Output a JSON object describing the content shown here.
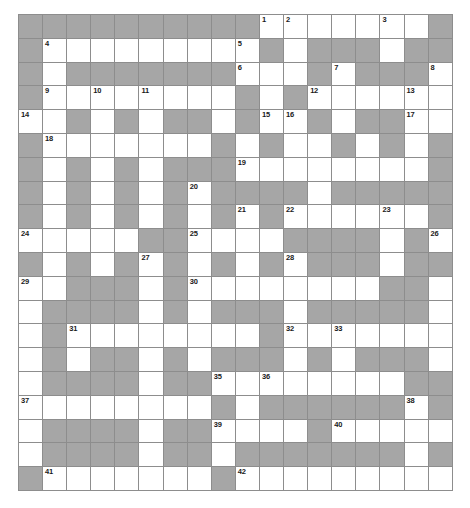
{
  "puzzle": {
    "kind": "crossword-grid",
    "title": "",
    "columns": 18,
    "rows": 20,
    "cell_size_px": 24,
    "colors": {
      "block": "#a6a6a6",
      "open": "#ffffff",
      "grid_line": "#8d8d8d",
      "number_text": "#1a1a1a",
      "page_background": "#ffffff"
    },
    "legend": {
      "block_meaning": "blocked square",
      "open_meaning": "fillable letter square"
    },
    "clue_numbers_present": [
      1,
      2,
      3,
      4,
      5,
      6,
      7,
      8,
      9,
      10,
      11,
      12,
      13,
      14,
      15,
      16,
      17,
      18,
      19,
      20,
      21,
      22,
      23,
      24,
      25,
      26,
      27,
      28,
      29,
      30,
      31,
      32,
      33,
      35,
      36,
      37,
      38,
      39,
      40,
      41,
      42
    ],
    "clue_number_count": 41,
    "max_clue_number": 42,
    "cells": [
      [
        {
          "t": "block"
        },
        {
          "t": "block"
        },
        {
          "t": "block"
        },
        {
          "t": "block"
        },
        {
          "t": "block"
        },
        {
          "t": "block"
        },
        {
          "t": "block"
        },
        {
          "t": "block"
        },
        {
          "t": "block"
        },
        {
          "t": "block"
        },
        {
          "t": "open",
          "n": "1"
        },
        {
          "t": "open",
          "n": "2"
        },
        {
          "t": "open"
        },
        {
          "t": "open"
        },
        {
          "t": "open"
        },
        {
          "t": "open",
          "n": "3"
        },
        {
          "t": "open"
        },
        {
          "t": "block"
        }
      ],
      [
        {
          "t": "block"
        },
        {
          "t": "open",
          "n": "4"
        },
        {
          "t": "open"
        },
        {
          "t": "open"
        },
        {
          "t": "open"
        },
        {
          "t": "open"
        },
        {
          "t": "open"
        },
        {
          "t": "open"
        },
        {
          "t": "open"
        },
        {
          "t": "open",
          "n": "5"
        },
        {
          "t": "block"
        },
        {
          "t": "open"
        },
        {
          "t": "block"
        },
        {
          "t": "block"
        },
        {
          "t": "block"
        },
        {
          "t": "open"
        },
        {
          "t": "block"
        },
        {
          "t": "block"
        }
      ],
      [
        {
          "t": "block"
        },
        {
          "t": "open"
        },
        {
          "t": "block"
        },
        {
          "t": "block"
        },
        {
          "t": "block"
        },
        {
          "t": "block"
        },
        {
          "t": "block"
        },
        {
          "t": "block"
        },
        {
          "t": "block"
        },
        {
          "t": "open",
          "n": "6"
        },
        {
          "t": "open"
        },
        {
          "t": "open"
        },
        {
          "t": "block"
        },
        {
          "t": "open",
          "n": "7"
        },
        {
          "t": "block"
        },
        {
          "t": "block"
        },
        {
          "t": "block"
        },
        {
          "t": "open",
          "n": "8"
        }
      ],
      [
        {
          "t": "block"
        },
        {
          "t": "open",
          "n": "9"
        },
        {
          "t": "open"
        },
        {
          "t": "open",
          "n": "10"
        },
        {
          "t": "open"
        },
        {
          "t": "open",
          "n": "11"
        },
        {
          "t": "open"
        },
        {
          "t": "open"
        },
        {
          "t": "open"
        },
        {
          "t": "block"
        },
        {
          "t": "open"
        },
        {
          "t": "block"
        },
        {
          "t": "open",
          "n": "12"
        },
        {
          "t": "open"
        },
        {
          "t": "open"
        },
        {
          "t": "open"
        },
        {
          "t": "open",
          "n": "13"
        },
        {
          "t": "open"
        }
      ],
      [
        {
          "t": "open",
          "n": "14"
        },
        {
          "t": "open"
        },
        {
          "t": "block"
        },
        {
          "t": "open"
        },
        {
          "t": "block"
        },
        {
          "t": "open"
        },
        {
          "t": "block"
        },
        {
          "t": "block"
        },
        {
          "t": "open"
        },
        {
          "t": "block"
        },
        {
          "t": "open",
          "n": "15"
        },
        {
          "t": "open",
          "n": "16"
        },
        {
          "t": "block"
        },
        {
          "t": "open"
        },
        {
          "t": "block"
        },
        {
          "t": "block"
        },
        {
          "t": "open",
          "n": "17"
        },
        {
          "t": "open"
        }
      ],
      [
        {
          "t": "block"
        },
        {
          "t": "open",
          "n": "18"
        },
        {
          "t": "open"
        },
        {
          "t": "open"
        },
        {
          "t": "open"
        },
        {
          "t": "open"
        },
        {
          "t": "open"
        },
        {
          "t": "open"
        },
        {
          "t": "block"
        },
        {
          "t": "open"
        },
        {
          "t": "block"
        },
        {
          "t": "open"
        },
        {
          "t": "open"
        },
        {
          "t": "block"
        },
        {
          "t": "open"
        },
        {
          "t": "block"
        },
        {
          "t": "open"
        },
        {
          "t": "block"
        }
      ],
      [
        {
          "t": "block"
        },
        {
          "t": "open"
        },
        {
          "t": "block"
        },
        {
          "t": "open"
        },
        {
          "t": "block"
        },
        {
          "t": "open"
        },
        {
          "t": "block"
        },
        {
          "t": "block"
        },
        {
          "t": "block"
        },
        {
          "t": "open",
          "n": "19"
        },
        {
          "t": "open"
        },
        {
          "t": "open"
        },
        {
          "t": "open"
        },
        {
          "t": "open"
        },
        {
          "t": "open"
        },
        {
          "t": "open"
        },
        {
          "t": "open"
        },
        {
          "t": "block"
        }
      ],
      [
        {
          "t": "block"
        },
        {
          "t": "open"
        },
        {
          "t": "block"
        },
        {
          "t": "open"
        },
        {
          "t": "block"
        },
        {
          "t": "open"
        },
        {
          "t": "block"
        },
        {
          "t": "open",
          "n": "20"
        },
        {
          "t": "block"
        },
        {
          "t": "block"
        },
        {
          "t": "block"
        },
        {
          "t": "block"
        },
        {
          "t": "open"
        },
        {
          "t": "block"
        },
        {
          "t": "block"
        },
        {
          "t": "block"
        },
        {
          "t": "block"
        },
        {
          "t": "block"
        }
      ],
      [
        {
          "t": "block"
        },
        {
          "t": "open"
        },
        {
          "t": "block"
        },
        {
          "t": "open"
        },
        {
          "t": "block"
        },
        {
          "t": "open"
        },
        {
          "t": "block"
        },
        {
          "t": "open"
        },
        {
          "t": "block"
        },
        {
          "t": "open",
          "n": "21"
        },
        {
          "t": "block"
        },
        {
          "t": "open",
          "n": "22"
        },
        {
          "t": "open"
        },
        {
          "t": "open"
        },
        {
          "t": "open"
        },
        {
          "t": "open",
          "n": "23"
        },
        {
          "t": "open"
        },
        {
          "t": "block"
        }
      ],
      [
        {
          "t": "open",
          "n": "24"
        },
        {
          "t": "open"
        },
        {
          "t": "open"
        },
        {
          "t": "open"
        },
        {
          "t": "open"
        },
        {
          "t": "block"
        },
        {
          "t": "block"
        },
        {
          "t": "open",
          "n": "25"
        },
        {
          "t": "open"
        },
        {
          "t": "open"
        },
        {
          "t": "open"
        },
        {
          "t": "block"
        },
        {
          "t": "block"
        },
        {
          "t": "block"
        },
        {
          "t": "block"
        },
        {
          "t": "open"
        },
        {
          "t": "block"
        },
        {
          "t": "open",
          "n": "26"
        }
      ],
      [
        {
          "t": "block"
        },
        {
          "t": "open"
        },
        {
          "t": "block"
        },
        {
          "t": "open"
        },
        {
          "t": "block"
        },
        {
          "t": "open",
          "n": "27"
        },
        {
          "t": "block"
        },
        {
          "t": "open"
        },
        {
          "t": "block"
        },
        {
          "t": "open"
        },
        {
          "t": "block"
        },
        {
          "t": "open",
          "n": "28"
        },
        {
          "t": "block"
        },
        {
          "t": "block"
        },
        {
          "t": "block"
        },
        {
          "t": "open"
        },
        {
          "t": "block"
        },
        {
          "t": "block"
        }
      ],
      [
        {
          "t": "open",
          "n": "29"
        },
        {
          "t": "open"
        },
        {
          "t": "block"
        },
        {
          "t": "block"
        },
        {
          "t": "block"
        },
        {
          "t": "open"
        },
        {
          "t": "block"
        },
        {
          "t": "open",
          "n": "30"
        },
        {
          "t": "open"
        },
        {
          "t": "open"
        },
        {
          "t": "open"
        },
        {
          "t": "open"
        },
        {
          "t": "open"
        },
        {
          "t": "open"
        },
        {
          "t": "open"
        },
        {
          "t": "block"
        },
        {
          "t": "block"
        },
        {
          "t": "open"
        }
      ],
      [
        {
          "t": "open"
        },
        {
          "t": "block"
        },
        {
          "t": "block"
        },
        {
          "t": "block"
        },
        {
          "t": "block"
        },
        {
          "t": "open"
        },
        {
          "t": "block"
        },
        {
          "t": "open"
        },
        {
          "t": "block"
        },
        {
          "t": "block"
        },
        {
          "t": "block"
        },
        {
          "t": "open"
        },
        {
          "t": "block"
        },
        {
          "t": "block"
        },
        {
          "t": "block"
        },
        {
          "t": "block"
        },
        {
          "t": "block"
        },
        {
          "t": "open"
        }
      ],
      [
        {
          "t": "open"
        },
        {
          "t": "block"
        },
        {
          "t": "open",
          "n": "31"
        },
        {
          "t": "open"
        },
        {
          "t": "open"
        },
        {
          "t": "open"
        },
        {
          "t": "open"
        },
        {
          "t": "open"
        },
        {
          "t": "open"
        },
        {
          "t": "open"
        },
        {
          "t": "block"
        },
        {
          "t": "open",
          "n": "32"
        },
        {
          "t": "open"
        },
        {
          "t": "open",
          "n": "33"
        },
        {
          "t": "open"
        },
        {
          "t": "open"
        },
        {
          "t": "open"
        },
        {
          "t": "open"
        }
      ],
      [
        {
          "t": "open"
        },
        {
          "t": "block"
        },
        {
          "t": "open"
        },
        {
          "t": "block"
        },
        {
          "t": "block"
        },
        {
          "t": "open"
        },
        {
          "t": "block"
        },
        {
          "t": "open"
        },
        {
          "t": "block"
        },
        {
          "t": "block"
        },
        {
          "t": "block"
        },
        {
          "t": "open"
        },
        {
          "t": "block"
        },
        {
          "t": "open"
        },
        {
          "t": "block"
        },
        {
          "t": "block"
        },
        {
          "t": "block"
        },
        {
          "t": "open"
        }
      ],
      [
        {
          "t": "open"
        },
        {
          "t": "block"
        },
        {
          "t": "block"
        },
        {
          "t": "block"
        },
        {
          "t": "block"
        },
        {
          "t": "open"
        },
        {
          "t": "block"
        },
        {
          "t": "block"
        },
        {
          "t": "open",
          "n": "35"
        },
        {
          "t": "open"
        },
        {
          "t": "open",
          "n": "36"
        },
        {
          "t": "open"
        },
        {
          "t": "open"
        },
        {
          "t": "open"
        },
        {
          "t": "open"
        },
        {
          "t": "open"
        },
        {
          "t": "block"
        },
        {
          "t": "block"
        }
      ],
      [
        {
          "t": "open",
          "n": "37"
        },
        {
          "t": "open"
        },
        {
          "t": "open"
        },
        {
          "t": "open"
        },
        {
          "t": "open"
        },
        {
          "t": "open"
        },
        {
          "t": "open"
        },
        {
          "t": "open"
        },
        {
          "t": "block"
        },
        {
          "t": "open"
        },
        {
          "t": "block"
        },
        {
          "t": "block"
        },
        {
          "t": "block"
        },
        {
          "t": "block"
        },
        {
          "t": "block"
        },
        {
          "t": "block"
        },
        {
          "t": "open",
          "n": "38"
        },
        {
          "t": "block"
        }
      ],
      [
        {
          "t": "open"
        },
        {
          "t": "block"
        },
        {
          "t": "block"
        },
        {
          "t": "block"
        },
        {
          "t": "block"
        },
        {
          "t": "open"
        },
        {
          "t": "block"
        },
        {
          "t": "block"
        },
        {
          "t": "open",
          "n": "39"
        },
        {
          "t": "open"
        },
        {
          "t": "open"
        },
        {
          "t": "open"
        },
        {
          "t": "block"
        },
        {
          "t": "open",
          "n": "40"
        },
        {
          "t": "open"
        },
        {
          "t": "open"
        },
        {
          "t": "open"
        },
        {
          "t": "open"
        }
      ],
      [
        {
          "t": "open"
        },
        {
          "t": "block"
        },
        {
          "t": "block"
        },
        {
          "t": "block"
        },
        {
          "t": "block"
        },
        {
          "t": "open"
        },
        {
          "t": "block"
        },
        {
          "t": "block"
        },
        {
          "t": "open"
        },
        {
          "t": "block"
        },
        {
          "t": "block"
        },
        {
          "t": "block"
        },
        {
          "t": "block"
        },
        {
          "t": "block"
        },
        {
          "t": "block"
        },
        {
          "t": "block"
        },
        {
          "t": "open"
        },
        {
          "t": "block"
        }
      ],
      [
        {
          "t": "block"
        },
        {
          "t": "open",
          "n": "41"
        },
        {
          "t": "open"
        },
        {
          "t": "open"
        },
        {
          "t": "open"
        },
        {
          "t": "open"
        },
        {
          "t": "open"
        },
        {
          "t": "open"
        },
        {
          "t": "block"
        },
        {
          "t": "open",
          "n": "42"
        },
        {
          "t": "open"
        },
        {
          "t": "open"
        },
        {
          "t": "open"
        },
        {
          "t": "open"
        },
        {
          "t": "open"
        },
        {
          "t": "open"
        },
        {
          "t": "open"
        },
        {
          "t": "open"
        }
      ]
    ]
  }
}
